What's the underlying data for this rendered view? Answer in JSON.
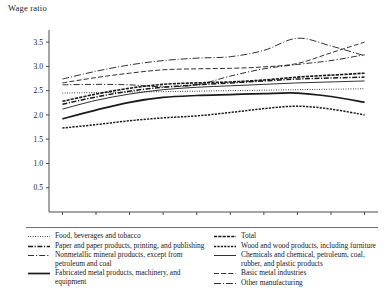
{
  "axis_title": "Wage ratio",
  "legend": {
    "left_column": [
      {
        "label": "Food, beverages and tobacco",
        "style": "dotted-fine"
      },
      {
        "label": "Paper and paper products, printing, and publishing",
        "style": "dash-dot-bold"
      },
      {
        "label": "Nonmetallic mineral products, except from petroleum and coal",
        "style": "dash-dot-thin"
      },
      {
        "label": "Fabricated metal products, machinery, and equipment",
        "style": "solid-bold"
      }
    ],
    "right_column": [
      {
        "label": "Total",
        "style": "dash-dense-bold"
      },
      {
        "label": "Wood and wood products, including furniture",
        "style": "dash-short-bold"
      },
      {
        "label": "Chemicals and chemical, petroleum, coal, rubber, and plastic products",
        "style": "solid-thin"
      },
      {
        "label": "Basic metal industries",
        "style": "dash-long"
      },
      {
        "label": "Other manufacturing",
        "style": "dash-dot-long"
      }
    ]
  },
  "chart_data": {
    "type": "line",
    "title": "",
    "xlabel": "",
    "ylabel": "Wage ratio",
    "x": [
      1988,
      1989,
      1990,
      1991,
      1992,
      1993,
      1994,
      1995,
      1996,
      1997
    ],
    "xticklabels": [
      "1988",
      "1989",
      "1990",
      "1991",
      "1992",
      "1993",
      "1994",
      "1995",
      "1996",
      "1997"
    ],
    "yticks": [
      0.5,
      1.0,
      1.5,
      2.0,
      2.5,
      3.0,
      3.5
    ],
    "ylim": [
      0,
      3.75
    ],
    "xlim": [
      1987.6,
      1997.4
    ],
    "grid": false,
    "legend_position": "below",
    "series": [
      {
        "name": "Other manufacturing",
        "style": "dash-dot-long",
        "values": [
          2.74,
          2.9,
          3.03,
          3.12,
          3.17,
          3.2,
          3.33,
          3.58,
          3.42,
          3.22
        ]
      },
      {
        "name": "Basic metal industries",
        "style": "dash-long",
        "values": [
          2.66,
          2.77,
          2.86,
          2.93,
          2.95,
          2.96,
          2.99,
          3.06,
          3.28,
          3.5
        ]
      },
      {
        "name": "Nonmetallic mineral products, except from petroleum and coal",
        "style": "dash-dot-thin",
        "values": [
          2.62,
          2.63,
          2.62,
          2.58,
          2.62,
          2.8,
          2.95,
          3.04,
          3.12,
          3.24
        ]
      },
      {
        "name": "Total",
        "style": "dash-dense-bold",
        "values": [
          2.28,
          2.43,
          2.55,
          2.63,
          2.66,
          2.68,
          2.72,
          2.78,
          2.82,
          2.86
        ]
      },
      {
        "name": "Paper and paper products, printing, and publishing",
        "style": "dash-dot-bold",
        "values": [
          2.22,
          2.37,
          2.49,
          2.57,
          2.62,
          2.66,
          2.7,
          2.74,
          2.76,
          2.78
        ]
      },
      {
        "name": "Chemicals and chemical, petroleum, coal, rubber, and plastic products",
        "style": "solid-thin",
        "values": [
          2.12,
          2.3,
          2.43,
          2.52,
          2.57,
          2.6,
          2.63,
          2.66,
          2.68,
          2.7
        ]
      },
      {
        "name": "Food, beverages and tobacco",
        "style": "dotted-fine",
        "values": [
          2.45,
          2.46,
          2.47,
          2.48,
          2.49,
          2.5,
          2.51,
          2.52,
          2.53,
          2.54
        ]
      },
      {
        "name": "Fabricated metal products, machinery, and equipment",
        "style": "solid-bold",
        "values": [
          1.92,
          2.1,
          2.26,
          2.36,
          2.4,
          2.42,
          2.44,
          2.45,
          2.38,
          2.26
        ]
      },
      {
        "name": "Wood and wood products, including furniture",
        "style": "dash-short-bold",
        "values": [
          1.73,
          1.8,
          1.88,
          1.94,
          1.98,
          2.05,
          2.13,
          2.18,
          2.12,
          2.0
        ]
      }
    ]
  }
}
